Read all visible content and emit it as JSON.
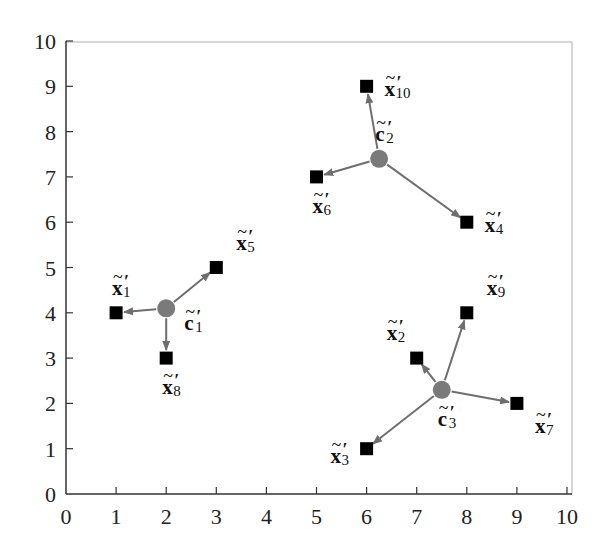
{
  "chart_data": {
    "type": "scatter",
    "title": "",
    "xlabel": "",
    "ylabel": "",
    "xlim": [
      0,
      10
    ],
    "ylim": [
      0,
      10
    ],
    "grid": false,
    "legend": null,
    "xticks": [
      0,
      1,
      2,
      3,
      4,
      5,
      6,
      7,
      8,
      9,
      10
    ],
    "yticks": [
      0,
      1,
      2,
      3,
      4,
      5,
      6,
      7,
      8,
      9,
      10
    ],
    "colors": {
      "axis": "#333333",
      "frame_light": "#c8c8c8",
      "point": "#000000",
      "centroid": "#7a7a7a",
      "arrow": "#6e6e6e"
    },
    "clusters": [
      {
        "centroid": {
          "label": "c",
          "index": "1",
          "x": 2.0,
          "y": 4.1,
          "label_pos": "right-below"
        },
        "points": [
          {
            "label": "x",
            "index": "1",
            "x": 1,
            "y": 4,
            "label_pos": "above"
          },
          {
            "label": "x",
            "index": "5",
            "x": 3,
            "y": 5,
            "label_pos": "above-right"
          },
          {
            "label": "x",
            "index": "8",
            "x": 2,
            "y": 3,
            "label_pos": "below"
          }
        ]
      },
      {
        "centroid": {
          "label": "c",
          "index": "2",
          "x": 6.25,
          "y": 7.4,
          "label_pos": "above"
        },
        "points": [
          {
            "label": "x",
            "index": "10",
            "x": 6,
            "y": 9,
            "label_pos": "right"
          },
          {
            "label": "x",
            "index": "6",
            "x": 5,
            "y": 7,
            "label_pos": "below"
          },
          {
            "label": "x",
            "index": "4",
            "x": 8,
            "y": 6,
            "label_pos": "right"
          }
        ]
      },
      {
        "centroid": {
          "label": "c",
          "index": "3",
          "x": 7.5,
          "y": 2.3,
          "label_pos": "below"
        },
        "points": [
          {
            "label": "x",
            "index": "2",
            "x": 7,
            "y": 3,
            "label_pos": "above-left"
          },
          {
            "label": "x",
            "index": "9",
            "x": 8,
            "y": 4,
            "label_pos": "above-right"
          },
          {
            "label": "x",
            "index": "7",
            "x": 9,
            "y": 2,
            "label_pos": "below-right"
          },
          {
            "label": "x",
            "index": "3",
            "x": 6,
            "y": 1,
            "label_pos": "left"
          }
        ]
      }
    ],
    "annotations": "Each label carries a tilde over the bold letter and a prime: x̃'ᵢ for data points, c̃'ⱼ for cluster centroids; arrows point from centroid to member points."
  }
}
